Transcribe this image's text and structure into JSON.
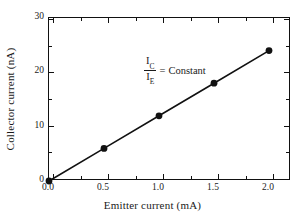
{
  "chart_data": {
    "type": "line",
    "title": "",
    "subtitle": "",
    "xlabel": "Emitter current (mA)",
    "ylabel": "Collector current (nA)",
    "x": [
      0.0,
      0.5,
      1.0,
      1.5,
      2.0
    ],
    "values": [
      0,
      6,
      12,
      18,
      24
    ],
    "series": [
      {
        "name": "Collector current vs emitter current",
        "x": [
          0.0,
          0.5,
          1.0,
          1.5,
          2.0
        ],
        "values": [
          0,
          6,
          12,
          18,
          24
        ]
      }
    ],
    "xlim": [
      0.0,
      2.2
    ],
    "ylim": [
      0,
      30
    ],
    "xticks": [
      "0.0",
      "0.5",
      "1.0",
      "1.5",
      "2.0"
    ],
    "xtick_values": [
      0.0,
      0.5,
      1.0,
      1.5,
      2.0
    ],
    "xminor_values": [
      0.25,
      0.75,
      1.25,
      1.75,
      2.15
    ],
    "yticks": [
      "0",
      "10",
      "20",
      "30"
    ],
    "ytick_values": [
      0,
      10,
      20,
      30
    ],
    "yminor_values": [
      5,
      15,
      25
    ],
    "grid": false,
    "legend": false,
    "legend_position": "none",
    "marker": "filled-circle",
    "line_color": "#111111",
    "marker_color": "#111111",
    "annotations": [
      {
        "numerator": "I",
        "numerator_sub": "C",
        "denominator": "I",
        "denominator_sub": "E",
        "equals": "=",
        "text": "Constant",
        "full_text": "I_C / I_E = Constant"
      }
    ]
  },
  "colors": {
    "background": "#ffffff",
    "axis": "#111111",
    "text": "#1a1a1a",
    "data": "#111111"
  }
}
